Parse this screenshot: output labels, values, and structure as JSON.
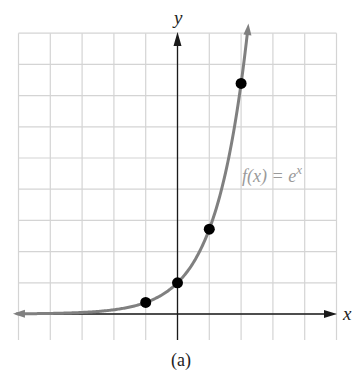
{
  "caption": "(a)",
  "chart_data": {
    "type": "line",
    "title": "",
    "function_label": "f(x) = e^x",
    "function_label_parts": {
      "lhs": "f(x) = e",
      "exponent": "x"
    },
    "xlabel": "x",
    "ylabel": "y",
    "xlim": [
      -5,
      5
    ],
    "ylim": [
      -1,
      9
    ],
    "grid": true,
    "grid_step": 1,
    "axis_tick_labels": false,
    "series": [
      {
        "name": "f(x) = e^x",
        "curve": "exp",
        "x_range": [
          -5,
          2.2
        ],
        "points": [
          {
            "x": -1,
            "y": 0.37
          },
          {
            "x": 0,
            "y": 1
          },
          {
            "x": 1,
            "y": 2.72
          },
          {
            "x": 2,
            "y": 7.39
          }
        ]
      }
    ],
    "colors": {
      "grid": "#d4d4d4",
      "axes": "#1a1a1a",
      "curve": "#808080",
      "points": "#000000",
      "label": "#9a9a9a"
    }
  }
}
